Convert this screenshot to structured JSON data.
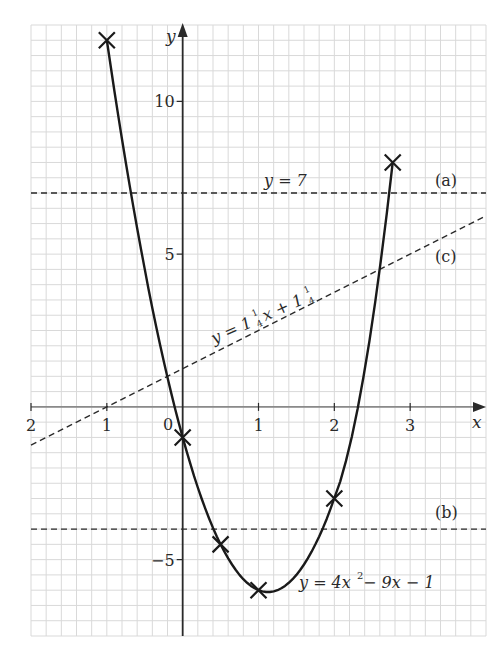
{
  "chart_data": {
    "type": "line",
    "title": "",
    "xlabel": "x",
    "ylabel": "y",
    "xlim": [
      -2,
      4
    ],
    "ylim": [
      -7.5,
      12.5
    ],
    "grid": true,
    "grid_minor_x": 0.2,
    "grid_minor_y": 0.5,
    "x_ticks": [
      {
        "value": -2,
        "label": "2"
      },
      {
        "value": -1,
        "label": "1"
      },
      {
        "value": 0,
        "label": "0"
      },
      {
        "value": 1,
        "label": "1"
      },
      {
        "value": 2,
        "label": "2"
      },
      {
        "value": 3,
        "label": "3"
      }
    ],
    "y_ticks": [
      {
        "value": 10,
        "label": "10"
      },
      {
        "value": 5,
        "label": "5"
      },
      {
        "value": -5,
        "label": "−5"
      }
    ],
    "series": [
      {
        "name": "y = 4x² − 9x − 1",
        "kind": "curve",
        "style": "solid",
        "marked_points": [
          {
            "x": -1,
            "y": 12
          },
          {
            "x": 0,
            "y": -1
          },
          {
            "x": 0.5,
            "y": -4.5
          },
          {
            "x": 1,
            "y": -6
          },
          {
            "x": 2,
            "y": -3
          },
          {
            "x": 2.77,
            "y": 8
          }
        ]
      },
      {
        "name": "y = 7",
        "tag": "(a)",
        "kind": "line",
        "style": "dashed",
        "y": 7
      },
      {
        "name": "y = 1¼x + 1¼",
        "tag": "(c)",
        "kind": "line",
        "style": "dashed",
        "slope": 1.25,
        "intercept": 1.25
      },
      {
        "name": "(b)",
        "tag": "(b)",
        "kind": "line",
        "style": "dashed",
        "y": -4
      }
    ]
  },
  "labels": {
    "axis_x": "x",
    "axis_y": "y",
    "origin": "0",
    "line_a_eq": "y = 7",
    "tag_a": "(a)",
    "tag_b": "(b)",
    "tag_c": "(c)",
    "line_c_eq_y": "y = 1",
    "line_c_eq_x": "x + 1",
    "frac_num": "1",
    "frac_den": "4",
    "curve_eq_y": "y = 4x",
    "curve_eq_sup": "2",
    "curve_eq_rest": " − 9x − 1"
  },
  "colors": {
    "grid": "#d9d9d9",
    "axis": "#2a2a2a",
    "curve": "#1a1a1a",
    "dashed": "#2a2a2a",
    "background": "#ffffff"
  }
}
